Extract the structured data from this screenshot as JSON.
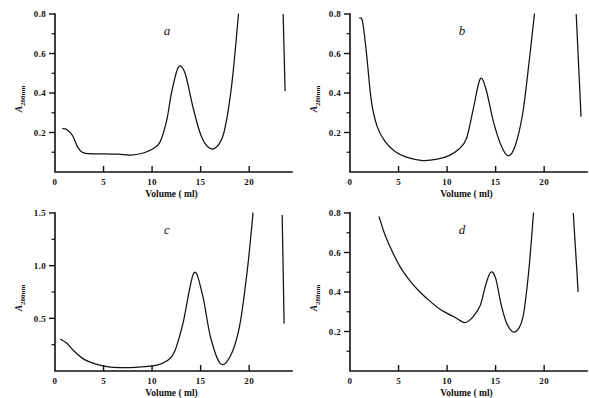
{
  "figure": {
    "name": "elution-profiles-figure",
    "panel_count": 4
  },
  "chart_data": [
    {
      "id": "a",
      "type": "line",
      "title": "a",
      "xlabel": "Volume ( ml)",
      "ylabel": "A280nm",
      "ylabel_base": "A",
      "ylabel_sub": "280nm",
      "xlim": [
        0,
        24
      ],
      "ylim": [
        0,
        0.8
      ],
      "xticks": [
        0,
        5,
        10,
        15,
        20
      ],
      "xticklabels": [
        "0",
        "5",
        "10",
        "15",
        "20"
      ],
      "yticks": [
        0.2,
        0.4,
        0.6,
        0.8
      ],
      "yticklabels": [
        "0.2",
        "0.4",
        "0.6",
        "0.8"
      ],
      "yminorticks": [
        0.1,
        0.3,
        0.5,
        0.7
      ],
      "grid": false,
      "legend": "none",
      "x": [
        0.8,
        1.2,
        1.8,
        2.3,
        2.8,
        3.5,
        5.0,
        6.5,
        7.8,
        9.0,
        10.0,
        10.8,
        11.5,
        12.0,
        12.7,
        13.4,
        14.2,
        15.0,
        15.8,
        16.6,
        17.4,
        18.2,
        18.9
      ],
      "y": [
        0.22,
        0.215,
        0.185,
        0.13,
        0.1,
        0.093,
        0.092,
        0.09,
        0.086,
        0.095,
        0.115,
        0.15,
        0.26,
        0.4,
        0.53,
        0.5,
        0.33,
        0.19,
        0.125,
        0.125,
        0.2,
        0.44,
        0.8
      ],
      "detached_segment": {
        "x": [
          23.5,
          23.7
        ],
        "y": [
          0.8,
          0.41
        ]
      },
      "annotations": [
        "peak 0.53 at 12.7 ml",
        "trough 0.12 at 16 ml"
      ]
    },
    {
      "id": "b",
      "type": "line",
      "title": "b",
      "xlabel": "Volume ( ml)",
      "ylabel": "A280nm",
      "ylabel_base": "A",
      "ylabel_sub": "280nm",
      "xlim": [
        0,
        24
      ],
      "ylim": [
        0,
        0.8
      ],
      "xticks": [
        0,
        5,
        10,
        15,
        20
      ],
      "xticklabels": [
        "0",
        "5",
        "10",
        "15",
        "20"
      ],
      "yticks": [
        0.2,
        0.4,
        0.6,
        0.8
      ],
      "yticklabels": [
        "0.2",
        "0.4",
        "0.6",
        "0.8"
      ],
      "yminorticks": [
        0.1,
        0.3,
        0.5,
        0.7
      ],
      "grid": false,
      "legend": "none",
      "x": [
        1.0,
        1.3,
        1.7,
        2.2,
        2.8,
        3.6,
        4.6,
        5.8,
        7.5,
        9.0,
        10.2,
        11.2,
        12.0,
        12.7,
        13.4,
        14.0,
        14.8,
        15.6,
        16.3,
        17.0,
        17.8,
        18.5,
        19.0
      ],
      "y": [
        0.78,
        0.76,
        0.6,
        0.36,
        0.23,
        0.155,
        0.105,
        0.075,
        0.058,
        0.065,
        0.083,
        0.115,
        0.17,
        0.32,
        0.47,
        0.42,
        0.25,
        0.13,
        0.082,
        0.13,
        0.3,
        0.58,
        0.8
      ],
      "detached_segment": {
        "x": [
          23.3,
          23.8
        ],
        "y": [
          0.8,
          0.28
        ]
      },
      "annotations": [
        "peak 0.47 at 13.4 ml",
        "minimum 0.06 at 7.5 ml"
      ]
    },
    {
      "id": "c",
      "type": "line",
      "title": "c",
      "xlabel": "Volume ( ml)",
      "ylabel": "A280nm",
      "ylabel_base": "A",
      "ylabel_sub": "280nm",
      "xlim": [
        0,
        24
      ],
      "ylim": [
        0,
        1.5
      ],
      "xticks": [
        0,
        5,
        10,
        15,
        20
      ],
      "xticklabels": [
        "0",
        "5",
        "10",
        "15",
        "20"
      ],
      "yticks": [
        0.5,
        1.0,
        1.5
      ],
      "yticklabels": [
        "0.5",
        "1.0",
        "1.5"
      ],
      "yminorticks": [
        0.25,
        0.75,
        1.25
      ],
      "grid": false,
      "legend": "none",
      "x": [
        0.6,
        1.2,
        2.0,
        3.0,
        4.2,
        5.5,
        6.8,
        8.2,
        9.5,
        10.5,
        11.5,
        12.3,
        13.2,
        14.3,
        15.2,
        16.0,
        17.0,
        18.0,
        19.0,
        19.8,
        20.4
      ],
      "y": [
        0.3,
        0.265,
        0.185,
        0.11,
        0.065,
        0.04,
        0.033,
        0.034,
        0.045,
        0.055,
        0.095,
        0.18,
        0.46,
        0.93,
        0.72,
        0.33,
        0.075,
        0.13,
        0.42,
        0.95,
        1.5
      ],
      "detached_segment": {
        "x": [
          23.4,
          23.6
        ],
        "y": [
          1.48,
          0.45
        ]
      },
      "annotations": [
        "peak 0.93 at 14.3 ml",
        "baseline ~0.03 from 5 to 10 ml"
      ]
    },
    {
      "id": "d",
      "type": "line",
      "title": "d",
      "xlabel": "Volume ( ml)",
      "ylabel": "A280nm",
      "ylabel_base": "A",
      "ylabel_sub": "280nm",
      "xlim": [
        0,
        24
      ],
      "ylim": [
        0,
        0.8
      ],
      "xticks": [
        0,
        5,
        10,
        15,
        20
      ],
      "xticklabels": [
        "0",
        "5",
        "10",
        "15",
        "20"
      ],
      "yticks": [
        0.2,
        0.4,
        0.6,
        0.8
      ],
      "yticklabels": [
        "0.2",
        "0.4",
        "0.6",
        "0.8"
      ],
      "yminorticks": [
        0.1,
        0.3,
        0.5,
        0.7
      ],
      "grid": false,
      "legend": "none",
      "x": [
        3.0,
        3.6,
        4.4,
        5.2,
        6.2,
        7.2,
        8.2,
        9.2,
        10.0,
        10.8,
        11.8,
        12.6,
        13.4,
        14.0,
        14.5,
        15.0,
        15.6,
        16.2,
        17.0,
        17.8,
        18.4,
        18.9
      ],
      "y": [
        0.78,
        0.69,
        0.6,
        0.525,
        0.455,
        0.4,
        0.355,
        0.315,
        0.292,
        0.272,
        0.245,
        0.27,
        0.33,
        0.44,
        0.5,
        0.47,
        0.33,
        0.235,
        0.198,
        0.27,
        0.5,
        0.8
      ],
      "detached_segment": {
        "x": [
          23.0,
          23.5
        ],
        "y": [
          0.8,
          0.4
        ]
      },
      "annotations": [
        "peak 0.50 at 14.5 ml",
        "shoulder ~0.29 at 10 ml",
        "trough 0.20 at 17 ml"
      ]
    }
  ]
}
